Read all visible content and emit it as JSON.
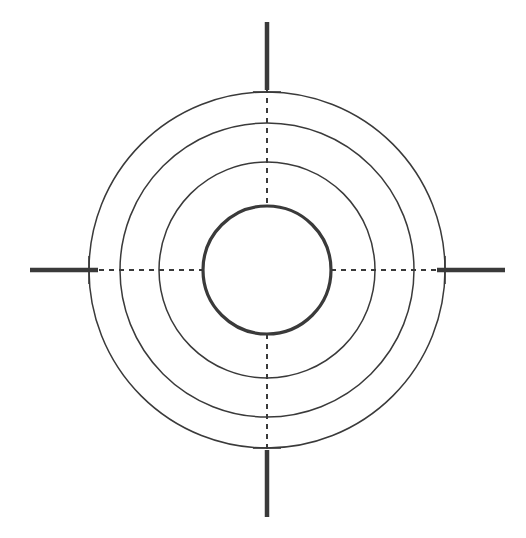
{
  "document": {
    "title": "Concentric Circle Target Diagram",
    "type": "technical-line-drawing",
    "background_color": "#ffffff",
    "width": 526,
    "height": 538
  },
  "chart_data": {
    "type": "scatter",
    "subtitle": "",
    "xlabel": "",
    "ylabel": "",
    "grid": false,
    "legend_position": "none",
    "xlim": [
      0,
      526
    ],
    "ylim": [
      0,
      538
    ],
    "center": {
      "x": 267,
      "y": 270
    },
    "series": [
      {
        "name": "inner-circle",
        "shape": "circle",
        "radius": 64,
        "stroke_width": 3.2,
        "stroke_color": "#3a3a3a",
        "fill": "none",
        "style": "solid"
      },
      {
        "name": "ring-2",
        "shape": "circle",
        "radius": 108,
        "stroke_width": 1.5,
        "stroke_color": "#3a3a3a",
        "fill": "none",
        "style": "solid"
      },
      {
        "name": "ring-3",
        "shape": "circle",
        "radius": 147,
        "stroke_width": 1.5,
        "stroke_color": "#3a3a3a",
        "fill": "none",
        "style": "solid"
      },
      {
        "name": "outer-ring",
        "shape": "circle",
        "radius": 178,
        "stroke_width": 1.5,
        "stroke_color": "#3a3a3a",
        "fill": "none",
        "style": "solid"
      }
    ]
  },
  "geometry": {
    "center_x": 267,
    "center_y": 270,
    "circles": [
      {
        "id": "inner-circle",
        "label": "Innermost bold circle",
        "radius": 64,
        "stroke_width": 3.2
      },
      {
        "id": "ring-2",
        "label": "Second ring",
        "radius": 108,
        "stroke_width": 1.5
      },
      {
        "id": "ring-3",
        "label": "Third ring",
        "radius": 147,
        "stroke_width": 1.5
      },
      {
        "id": "outer-ring",
        "label": "Outermost ring",
        "radius": 178,
        "stroke_width": 1.5
      }
    ],
    "axes": {
      "dash_pattern": "5 5",
      "dash_stroke_width": 1.6,
      "dash_color": "#3a3a3a",
      "tick_stroke_width": 4.5,
      "tick_color": "#3a3a3a",
      "cross_tick_half_length": 14,
      "cross_tick_stroke_width": 1.6
    },
    "ticks": [
      {
        "id": "tick-top",
        "label": "Top centre mark",
        "orientation": "vertical",
        "from": 22,
        "to": 90
      },
      {
        "id": "tick-bottom",
        "label": "Bottom centre mark",
        "orientation": "vertical",
        "from": 450,
        "to": 517
      },
      {
        "id": "tick-left",
        "label": "Left centre mark",
        "orientation": "horizontal",
        "from": 30,
        "to": 98
      },
      {
        "id": "tick-right",
        "label": "Right centre mark",
        "orientation": "horizontal",
        "from": 437,
        "to": 505
      }
    ],
    "dashed_axes": [
      {
        "id": "axis-vertical-upper",
        "label": "Vertical centreline above core",
        "from": 88,
        "to": 206
      },
      {
        "id": "axis-vertical-lower",
        "label": "Vertical centreline below core",
        "from": 334,
        "to": 452
      },
      {
        "id": "axis-horizontal-left",
        "label": "Horizontal centreline left of core",
        "from": 89,
        "to": 205
      },
      {
        "id": "axis-horizontal-right",
        "label": "Horizontal centreline right of core",
        "from": 331,
        "to": 447
      }
    ]
  },
  "colors": {
    "stroke": "#3a3a3a",
    "stroke_light": "#3f3f3f",
    "background": "#ffffff"
  }
}
